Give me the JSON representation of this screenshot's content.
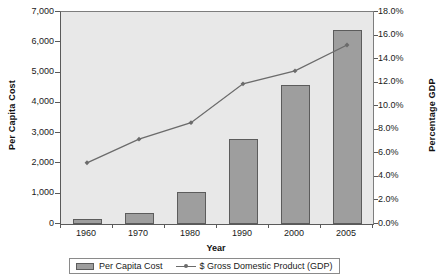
{
  "chart_data": {
    "type": "bar",
    "title": "",
    "subtitle": "",
    "xlabel": "Year",
    "ylabel": "Per Capita Cost",
    "ylabel_secondary": "Percentage GDP",
    "categories": [
      "1960",
      "1970",
      "1980",
      "1990",
      "2000",
      "2005"
    ],
    "grid": false,
    "legend_position": "bottom",
    "axes": {
      "left": {
        "label": "Per Capita Cost",
        "min": 0,
        "max": 7000,
        "tick_step": 1000,
        "tick_labels": [
          "7,000",
          "6,000",
          "5,000",
          "4,000",
          "3,000",
          "2,000",
          "1,000",
          "0"
        ],
        "tick_values": [
          7000,
          6000,
          5000,
          4000,
          3000,
          2000,
          1000,
          0
        ]
      },
      "right": {
        "label": "Percentage GDP",
        "min": 0,
        "max": 18,
        "tick_step": 2,
        "unit": "%",
        "tick_labels": [
          "18.0%",
          "16.0%",
          "14.0%",
          "12.0%",
          "10.0%",
          "8.0%",
          "6.0%",
          "4.0%",
          "2.0%",
          "0.0%"
        ],
        "tick_values": [
          18,
          16,
          14,
          12,
          10,
          8,
          6,
          4,
          2,
          0
        ]
      }
    },
    "series": [
      {
        "name": "Per Capita Cost",
        "type": "bar",
        "axis": "left",
        "color": "#9e9e9e",
        "border_color": "#5c5c5c",
        "values": [
          150,
          350,
          1070,
          2800,
          4600,
          6400
        ]
      },
      {
        "name": "$ Gross Domestic Product (GDP)",
        "type": "line",
        "axis": "right",
        "color": "#6b6b6b",
        "marker": "diamond",
        "values": [
          5.2,
          7.2,
          8.6,
          11.9,
          13.0,
          15.2
        ]
      }
    ]
  },
  "legend": {
    "entries": [
      {
        "label": "Per Capita Cost",
        "symbol": "bar-swatch"
      },
      {
        "label": "$ Gross Domestic Product (GDP)",
        "symbol": "line-marker-swatch"
      }
    ]
  },
  "colors": {
    "plot_background": "#e8e8e8",
    "page_background": "#ffffff",
    "bar_fill": "#9e9e9e",
    "bar_stroke": "#5c5c5c",
    "line": "#6b6b6b",
    "axis": "#5a5a5a",
    "text": "#1a1a1a"
  }
}
